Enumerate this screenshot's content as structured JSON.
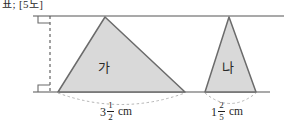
{
  "header": {
    "clipped_text": "표; [5도]"
  },
  "diagram": {
    "type": "geometry-two-triangles-between-parallels",
    "top_line_label": "top-parallel-line",
    "bottom_line_label": "bottom-parallel-line",
    "height_marker": "dashed-height-line",
    "right_angle_top": "right-angle-mark-top",
    "right_angle_bottom": "right-angle-mark-bottom",
    "fill_color": "#d9d9d9",
    "stroke_color": "#6b6b6b",
    "line_color": "#8c8c8c",
    "arc_color": "#b5b5b5",
    "triangles": [
      {
        "name": "ga",
        "label": "가",
        "base_measure": {
          "whole": "3",
          "numerator": "1",
          "denominator": "2",
          "unit": "cm"
        }
      },
      {
        "name": "na",
        "label": "나",
        "base_measure": {
          "whole": "1",
          "numerator": "2",
          "denominator": "5",
          "unit": "cm"
        }
      }
    ]
  }
}
